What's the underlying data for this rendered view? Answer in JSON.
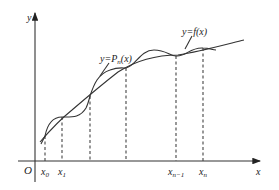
{
  "diagram": {
    "type": "interpolation-plot",
    "colors": {
      "line": "#333333",
      "text": "#222222",
      "background": "#ffffff"
    },
    "axes": {
      "x_label": "x",
      "y_label": "y",
      "origin_label": "O"
    },
    "curves": [
      {
        "id": "f",
        "label_prefix": "y=",
        "label_func": "f",
        "label_arg": "(x)"
      },
      {
        "id": "Pn",
        "label_prefix": "y=",
        "label_func": "P",
        "label_sub": "n",
        "label_arg": "(x)"
      }
    ],
    "nodes": [
      {
        "label": "x",
        "sub": "0"
      },
      {
        "label": "x",
        "sub": "1"
      },
      {
        "label": "",
        "sub": ""
      },
      {
        "label": "",
        "sub": ""
      },
      {
        "label": "x",
        "sub": "n−1"
      },
      {
        "label": "x",
        "sub": "n"
      }
    ]
  }
}
